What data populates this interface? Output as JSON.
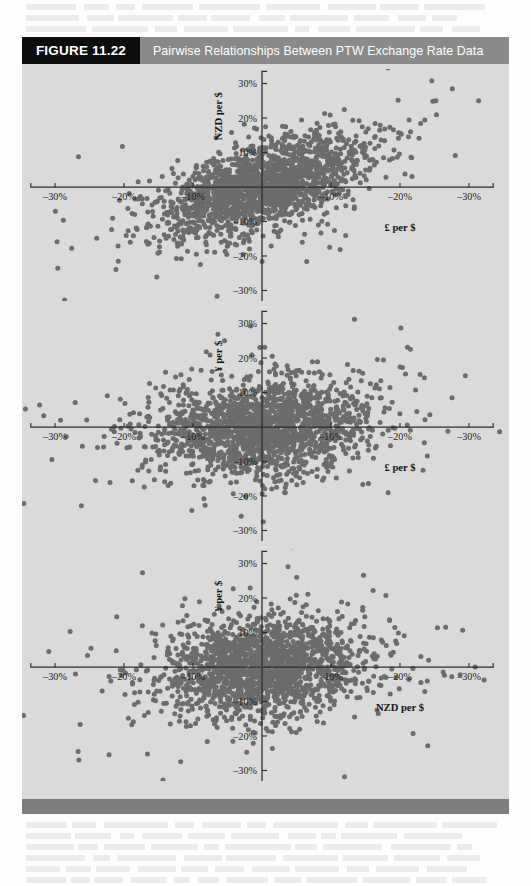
{
  "figure": {
    "tag": "FIGURE 11.22",
    "title": "Pairwise Relationships Between PTW Exchange Rate Data",
    "panel_bg": "#dadada",
    "tag_bg": "#0d0d0d",
    "title_bg": "#8a8a8a",
    "footer_bar_color": "#7d7d7d",
    "dot_color": "#6c6c6c",
    "axis_color": "#2a2a2a"
  },
  "chart_data": [
    {
      "type": "scatter",
      "title": "",
      "xlabel": "£ per $",
      "ylabel": "NZD per $",
      "xlim": [
        -0.36,
        0.36
      ],
      "ylim": [
        -0.36,
        0.36
      ],
      "grid": false,
      "legend_position": "none",
      "x_tick_values": [
        -0.3,
        -0.2,
        -0.1,
        0.1,
        0.2,
        0.3
      ],
      "x_tick_labels": [
        "–30%",
        "–20%",
        "–10%",
        "–10%",
        "–20%",
        "–30%"
      ],
      "y_tick_values": [
        0.3,
        0.2,
        0.1,
        -0.1,
        -0.2,
        -0.3
      ],
      "y_tick_labels": [
        "30%",
        "20%",
        "10%",
        "–10%",
        "–20%",
        "–30%"
      ],
      "n_points": 1850,
      "correlation": 0.58,
      "x_sigma": 0.072,
      "y_sigma": 0.07,
      "seed": 17,
      "point_radius": 2.5,
      "annotations": []
    },
    {
      "type": "scatter",
      "title": "",
      "xlabel": "£ per $",
      "ylabel": "¥ per $",
      "xlim": [
        -0.36,
        0.36
      ],
      "ylim": [
        -0.36,
        0.36
      ],
      "grid": false,
      "legend_position": "none",
      "x_tick_values": [
        -0.3,
        -0.2,
        -0.1,
        0.1,
        0.2,
        0.3
      ],
      "x_tick_labels": [
        "–30%",
        "–20%",
        "–10%",
        "–10%",
        "–20%",
        "–30%"
      ],
      "y_tick_values": [
        0.3,
        0.2,
        0.1,
        -0.1,
        -0.2,
        -0.3
      ],
      "y_tick_labels": [
        "30%",
        "20%",
        "10%",
        "–10%",
        "–20%",
        "–30%"
      ],
      "n_points": 1850,
      "correlation": 0.18,
      "x_sigma": 0.074,
      "y_sigma": 0.066,
      "seed": 43,
      "point_radius": 2.5,
      "annotations": []
    },
    {
      "type": "scatter",
      "title": "",
      "xlabel": "NZD per $",
      "ylabel": "¥ per $",
      "xlim": [
        -0.36,
        0.36
      ],
      "ylim": [
        -0.36,
        0.36
      ],
      "grid": false,
      "legend_position": "none",
      "x_tick_values": [
        -0.3,
        -0.2,
        -0.1,
        0.1,
        0.2,
        0.3
      ],
      "x_tick_labels": [
        "–30%",
        "–20%",
        "–10%",
        "–10%",
        "–20%",
        "–30%"
      ],
      "y_tick_values": [
        0.3,
        0.2,
        0.1,
        -0.1,
        -0.2,
        -0.3
      ],
      "y_tick_labels": [
        "30%",
        "20%",
        "10%",
        "–10%",
        "–20%",
        "–30%"
      ],
      "n_points": 1850,
      "correlation": 0.1,
      "x_sigma": 0.07,
      "y_sigma": 0.068,
      "seed": 91,
      "point_radius": 2.5,
      "annotations": []
    }
  ]
}
